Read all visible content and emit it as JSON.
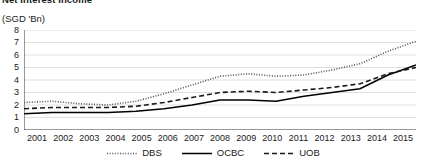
{
  "chart_data": {
    "type": "line",
    "title": "Net Interest Income",
    "ylabel": "(SGD 'Bn)",
    "xlabel": "",
    "ylim": [
      0,
      8
    ],
    "ystep": 1,
    "grid": true,
    "legend_position": "bottom",
    "categories": [
      "2001",
      "2002",
      "2003",
      "2004",
      "2005",
      "2006",
      "2007",
      "2008",
      "2009",
      "2010",
      "2011",
      "2012",
      "2013",
      "2014",
      "2015"
    ],
    "ytick_labels": [
      "8",
      "7",
      "6",
      "5",
      "4",
      "3",
      "2",
      "1",
      "0"
    ],
    "series": [
      {
        "name": "DBS",
        "style": "dotted",
        "color": "#555555",
        "values": [
          2.2,
          2.3,
          2.1,
          2.0,
          2.3,
          2.9,
          3.6,
          4.3,
          4.5,
          4.3,
          4.4,
          4.8,
          5.3,
          6.3,
          7.1
        ]
      },
      {
        "name": "OCBC",
        "style": "solid",
        "color": "#000000",
        "values": [
          1.3,
          1.4,
          1.4,
          1.4,
          1.5,
          1.7,
          2.0,
          2.4,
          2.4,
          2.3,
          2.7,
          3.0,
          3.3,
          4.4,
          5.2
        ]
      },
      {
        "name": "UOB",
        "style": "dashed",
        "color": "#1a1a1a",
        "values": [
          1.7,
          1.8,
          1.8,
          1.8,
          1.9,
          2.2,
          2.6,
          3.0,
          3.1,
          3.0,
          3.2,
          3.4,
          3.7,
          4.5,
          5.0
        ]
      }
    ]
  }
}
